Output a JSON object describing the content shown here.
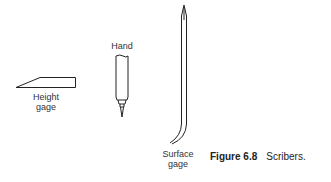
{
  "figure": {
    "number_label": "Figure 6.8",
    "caption_text": "Scribers.",
    "items": [
      {
        "name": "height-gage",
        "label_line1": "Height",
        "label_line2": "gage"
      },
      {
        "name": "hand",
        "label_line1": "Hand"
      },
      {
        "name": "surface-gage",
        "label_line1": "Surface",
        "label_line2": "gage"
      }
    ]
  }
}
